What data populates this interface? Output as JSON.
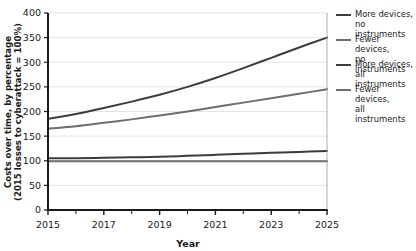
{
  "chart_data": {
    "type": "line",
    "title": "",
    "xlabel": "Year",
    "ylabel": "Costs over time, by percentage (2015 losses to cyberattack = 100%)",
    "ylabel_line1": "Costs over time, by percentage",
    "ylabel_line2": "(2015 losses to cyberattack = 100%)",
    "xlim": [
      2015,
      2025
    ],
    "ylim": [
      0,
      400
    ],
    "grid": true,
    "legend_position": "right",
    "x_ticks": [
      "2015",
      "2017",
      "2019",
      "2021",
      "2023",
      "2025"
    ],
    "x_tick_values": [
      2015,
      2017,
      2019,
      2021,
      2023,
      2025
    ],
    "x_minor_ticks": [
      2016,
      2018,
      2020,
      2022,
      2024
    ],
    "y_ticks": [
      "0",
      "50",
      "100",
      "150",
      "200",
      "250",
      "300",
      "350",
      "400"
    ],
    "y_tick_values": [
      0,
      50,
      100,
      150,
      200,
      250,
      300,
      350,
      400
    ],
    "x": [
      2015,
      2016,
      2017,
      2018,
      2019,
      2020,
      2021,
      2022,
      2023,
      2024,
      2025
    ],
    "series": [
      {
        "name": "More devices, no instruments",
        "label_line1": "More devices,",
        "label_line2": "no instruments",
        "color": "#3c3c3c",
        "values": [
          185,
          195,
          207,
          220,
          234,
          250,
          268,
          288,
          309,
          330,
          350
        ]
      },
      {
        "name": "Fewer devices, no instruments",
        "label_line1": "Fewer devices,",
        "label_line2": "no instruments",
        "color": "#6e6e6e",
        "values": [
          165,
          170,
          177,
          184,
          192,
          200,
          209,
          218,
          227,
          236,
          245
        ]
      },
      {
        "name": "More devices, all instruments",
        "label_line1": "More devices,",
        "label_line2": "all instruments",
        "color": "#3c3c3c",
        "values": [
          105,
          105,
          106,
          107,
          108,
          110,
          112,
          114,
          116,
          118,
          120
        ]
      },
      {
        "name": "Fewer devices, all instruments",
        "label_line1": "Fewer devices,",
        "label_line2": "all instruments",
        "color": "#6e6e6e",
        "values": [
          99,
          99,
          99,
          99,
          99,
          99,
          99,
          99,
          99,
          99,
          99
        ]
      }
    ]
  },
  "colors": {
    "axis": "#1a1a1a",
    "grid": "#e4e4e4",
    "background": "#ffffff",
    "dark_series": "#3c3c3c",
    "light_series": "#6e6e6e"
  }
}
